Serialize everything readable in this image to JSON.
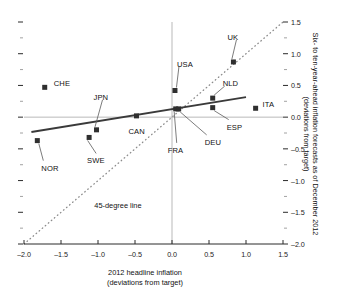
{
  "chart_data": {
    "type": "scatter",
    "title": "",
    "subtitle": "",
    "xlabel": "2012 headline inflation",
    "xlabel_line2": "(deviations from target)",
    "ylabel": "Six- to ten-year-ahead inflation forecasts as of December 2012",
    "ylabel_line2": "(deviations from target)",
    "xlim": [
      -2.0,
      1.5
    ],
    "ylim": [
      -2.0,
      1.5
    ],
    "xticks": [
      "-2.0",
      "-1.5",
      "-1.0",
      "-0.5",
      "0.0",
      "0.5",
      "1.0",
      "1.5"
    ],
    "xtick_values": [
      -2.0,
      -1.5,
      -1.0,
      -0.5,
      0.0,
      0.5,
      1.0,
      1.5
    ],
    "yticks": [
      "1.5",
      "1.0",
      "0.5",
      "0.0",
      "-0.5",
      "-1.0",
      "-1.5",
      "-2.0"
    ],
    "ytick_values": [
      1.5,
      1.0,
      0.5,
      0.0,
      -0.5,
      -1.0,
      -1.5,
      -2.0
    ],
    "y_axis_position": "right",
    "grid": false,
    "points": [
      {
        "name": "CHE",
        "x": -1.72,
        "y": 0.47,
        "label_dx": 9,
        "label_dy": -3,
        "leader": false
      },
      {
        "name": "NOR",
        "x": -1.82,
        "y": -0.37,
        "label_dx": 4,
        "label_dy": 28,
        "leader": true
      },
      {
        "name": "SWE",
        "x": -1.12,
        "y": -0.32,
        "label_dx": -2,
        "label_dy": 24,
        "leader": true
      },
      {
        "name": "JPN",
        "x": -1.02,
        "y": -0.2,
        "label_dx": -3,
        "label_dy": -32,
        "leader": true
      },
      {
        "name": "CAN",
        "x": -0.48,
        "y": 0.02,
        "label_dx": -8,
        "label_dy": 16,
        "leader": false
      },
      {
        "name": "FRA",
        "x": 0.05,
        "y": 0.13,
        "label_dx": -8,
        "label_dy": 42,
        "leader": true
      },
      {
        "name": "DEU",
        "x": 0.09,
        "y": 0.13,
        "label_dx": 26,
        "label_dy": 34,
        "leader": true
      },
      {
        "name": "USA",
        "x": 0.04,
        "y": 0.42,
        "label_dx": 2,
        "label_dy": -26,
        "leader": true
      },
      {
        "name": "NLD",
        "x": 0.55,
        "y": 0.3,
        "label_dx": 10,
        "label_dy": -14,
        "leader": true
      },
      {
        "name": "ESP",
        "x": 0.55,
        "y": 0.15,
        "label_dx": 14,
        "label_dy": 20,
        "leader": true
      },
      {
        "name": "UK",
        "x": 0.83,
        "y": 0.87,
        "label_dx": -6,
        "label_dy": -24,
        "leader": true
      },
      {
        "name": "ITA",
        "x": 1.13,
        "y": 0.14,
        "label_dx": 7,
        "label_dy": -3,
        "leader": false
      }
    ],
    "series": [
      {
        "name": "fitted-regression-line",
        "type": "line",
        "style": "solid",
        "color": "#3a3a3a",
        "x": [
          -1.9,
          1.0
        ],
        "y": [
          -0.235,
          0.315
        ]
      },
      {
        "name": "45-degree line",
        "type": "line",
        "style": "dotted",
        "color": "#8c8c8c",
        "x": [
          -2.0,
          1.5
        ],
        "y": [
          -2.0,
          1.5
        ]
      }
    ],
    "annotations": [
      {
        "name": "45-degree-line-label",
        "text": "45-degree line",
        "x": -1.05,
        "y": -1.4
      }
    ]
  }
}
